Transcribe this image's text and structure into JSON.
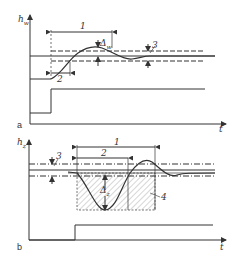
{
  "figure": {
    "panel_a": {
      "label": "a",
      "y_axis_label": "h",
      "y_axis_sub": "w",
      "x_axis_label": "t",
      "dim_1": "1",
      "dim_2": "2",
      "dim_3": "3",
      "delta_label": "Δ",
      "delta_sub": "w"
    },
    "panel_b": {
      "label": "b",
      "y_axis_label": "h",
      "y_axis_sub": "z",
      "x_axis_label": "t",
      "dim_1": "1",
      "dim_2": "2",
      "dim_3": "3",
      "dim_4": "4",
      "delta_label": "Δ",
      "delta_sub": "z"
    },
    "colors": {
      "line": "#333333",
      "hatch": "#888888",
      "background": "#ffffff"
    }
  }
}
